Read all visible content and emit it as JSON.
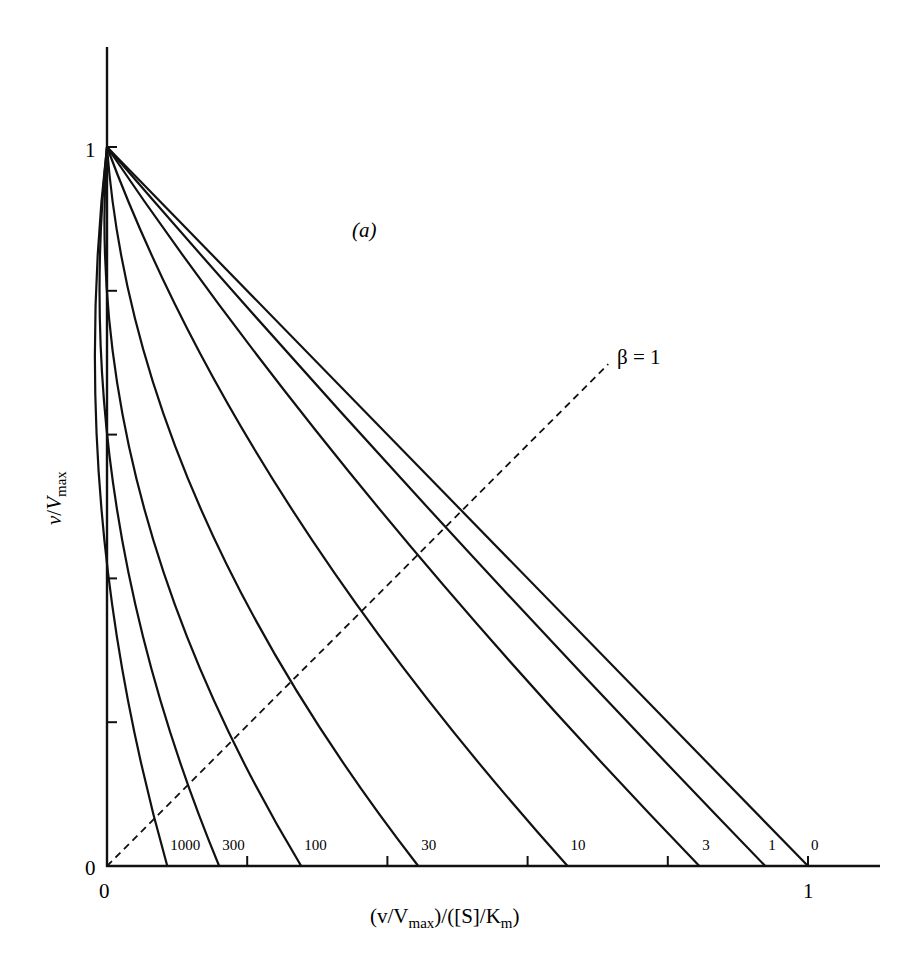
{
  "chart_data": {
    "type": "line",
    "title": "",
    "panel_label": "(a)",
    "xlabel": "(v/Vmax)/([S]/Km)",
    "ylabel": "v/Vmax",
    "xlim": [
      0,
      1.1
    ],
    "ylim": [
      0,
      1.15
    ],
    "grid": false,
    "x_ticks": [
      0,
      0.2,
      0.4,
      0.6,
      0.8,
      1
    ],
    "y_ticks": [
      0,
      0.2,
      0.4,
      0.6,
      0.8,
      1
    ],
    "x_tick_labels": [
      "0",
      "",
      "",
      "",
      "",
      "1"
    ],
    "y_tick_labels": [
      "0",
      "",
      "",
      "",
      "",
      "1"
    ],
    "series": [
      {
        "name": "1000",
        "x": [
          0,
          0.086
        ],
        "y": [
          1,
          0
        ],
        "x_intercept": 0.086,
        "curvature": 0.1
      },
      {
        "name": "300",
        "x": [
          0,
          0.16
        ],
        "y": [
          1,
          0
        ],
        "x_intercept": 0.16,
        "curvature": 0.13
      },
      {
        "name": "100",
        "x": [
          0,
          0.277
        ],
        "y": [
          1,
          0
        ],
        "x_intercept": 0.277,
        "curvature": 0.17
      },
      {
        "name": "30",
        "x": [
          0,
          0.444
        ],
        "y": [
          1,
          0
        ],
        "x_intercept": 0.444,
        "curvature": 0.18
      },
      {
        "name": "10",
        "x": [
          0,
          0.657
        ],
        "y": [
          1,
          0
        ],
        "x_intercept": 0.657,
        "curvature": 0.14
      },
      {
        "name": "3",
        "x": [
          0,
          0.845
        ],
        "y": [
          1,
          0
        ],
        "x_intercept": 0.845,
        "curvature": 0.08
      },
      {
        "name": "1",
        "x": [
          0,
          0.939
        ],
        "y": [
          1,
          0
        ],
        "x_intercept": 0.939,
        "curvature": 0.03
      },
      {
        "name": "0",
        "x": [
          0,
          1.0
        ],
        "y": [
          1,
          0
        ],
        "x_intercept": 1.0,
        "curvature": 0.0
      }
    ],
    "reference_line": {
      "name": "β = 1",
      "style": "dashed",
      "x": [
        0,
        0.715
      ],
      "y": [
        0,
        0.698
      ]
    },
    "annotations": [
      "(a)",
      "β = 1",
      "1000",
      "300",
      "100",
      "30",
      "10",
      "3",
      "1",
      "0"
    ]
  },
  "labels": {
    "panel": "(a)",
    "beta": "β = 1",
    "y_one": "1",
    "y_zero": "0",
    "x_zero": "0",
    "x_one": "1",
    "ylabel_v": "v",
    "ylabel_slash": "/",
    "ylabel_V": "V",
    "ylabel_sub": "max",
    "xlabel_pre": "(v/V",
    "xlabel_sub": "max",
    "xlabel_mid": ")/([S]/K",
    "xlabel_sub2": "m",
    "xlabel_post": ")"
  }
}
